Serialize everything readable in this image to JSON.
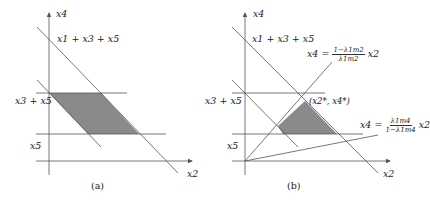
{
  "panels": [
    {
      "id": "a",
      "caption": "(a)",
      "labels": {
        "y_axis": "x4",
        "x_axis": "x2",
        "upper_line": "x1 + x3 + x5",
        "mid_level": "x3 + x5",
        "low_level": "x5"
      }
    },
    {
      "id": "b",
      "caption": "(b)",
      "labels": {
        "y_axis": "x4",
        "x_axis": "x2",
        "upper_line": "x1 + x3 + x5",
        "mid_level": "x3 + x5",
        "low_level": "x5",
        "point": "(x2*, x4*)",
        "ray_upper_lhs": "x4 =",
        "ray_upper_num": "1−λ1m2",
        "ray_upper_den": "λ1m2",
        "ray_upper_rhs": "x2",
        "ray_lower_lhs": "x4 =",
        "ray_lower_num": "λ1m4",
        "ray_lower_den": "1−λ1m4",
        "ray_lower_rhs": "x2"
      }
    }
  ],
  "colors": {
    "line": "#555555",
    "shade": "#8a8a8a"
  }
}
